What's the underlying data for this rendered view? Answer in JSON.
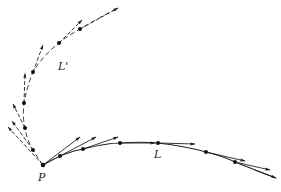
{
  "diagram": {
    "labels": {
      "point_P": "P",
      "curve_L": "L",
      "curve_L_prime": "L'"
    },
    "colors": {
      "stroke": "#222222",
      "background": "#ffffff"
    },
    "curve_L": {
      "style": "solid",
      "path": "M43,165 C55,158 70,151 83,149 C100,145 110,143 120,143 C135,142 148,142 158,143 C175,145 192,148 206,152 C218,155 227,158 235,162 C250,168 262,173 276,178",
      "points": [
        [
          60,
          156
        ],
        [
          83,
          149
        ],
        [
          120,
          143
        ],
        [
          158,
          143
        ],
        [
          206,
          152
        ],
        [
          235,
          162
        ]
      ],
      "tangents": [
        {
          "from": [
            43,
            165
          ],
          "to": [
            80,
            137
          ]
        },
        {
          "from": [
            60,
            156
          ],
          "to": [
            96,
            137
          ]
        },
        {
          "from": [
            83,
            149
          ],
          "to": [
            118,
            137
          ]
        },
        {
          "from": [
            120,
            143
          ],
          "to": [
            155,
            143
          ]
        },
        {
          "from": [
            158,
            143
          ],
          "to": [
            195,
            144
          ]
        },
        {
          "from": [
            206,
            152
          ],
          "to": [
            245,
            161
          ]
        },
        {
          "from": [
            235,
            162
          ],
          "to": [
            270,
            170
          ]
        },
        {
          "from": [
            255,
            170
          ],
          "to": [
            276,
            178
          ]
        }
      ]
    },
    "curve_L_prime": {
      "style": "dashed",
      "path": "M43,165 C38,158 36,155 33,150 C28,141 26,135 25,128 C23,120 23,111 24,103 C26,92 29,82 33,72 C40,60 50,50 59,43 C66,37 73,33 80,29 C92,22 104,15 118,8",
      "points": [
        [
          33,
          150
        ],
        [
          25,
          128
        ],
        [
          24,
          103
        ],
        [
          33,
          72
        ],
        [
          59,
          43
        ],
        [
          80,
          29
        ]
      ],
      "tangents": [
        {
          "from": [
            43,
            165
          ],
          "to": [
            8,
            127
          ]
        },
        {
          "from": [
            33,
            150
          ],
          "to": [
            12,
            121
          ]
        },
        {
          "from": [
            25,
            128
          ],
          "to": [
            13,
            104
          ]
        },
        {
          "from": [
            24,
            103
          ],
          "to": [
            25,
            73
          ]
        },
        {
          "from": [
            33,
            72
          ],
          "to": [
            43,
            45
          ]
        },
        {
          "from": [
            59,
            43
          ],
          "to": [
            82,
            20
          ]
        },
        {
          "from": [
            80,
            29
          ],
          "to": [
            118,
            8
          ]
        }
      ]
    },
    "point_P_position": [
      43,
      165
    ]
  }
}
